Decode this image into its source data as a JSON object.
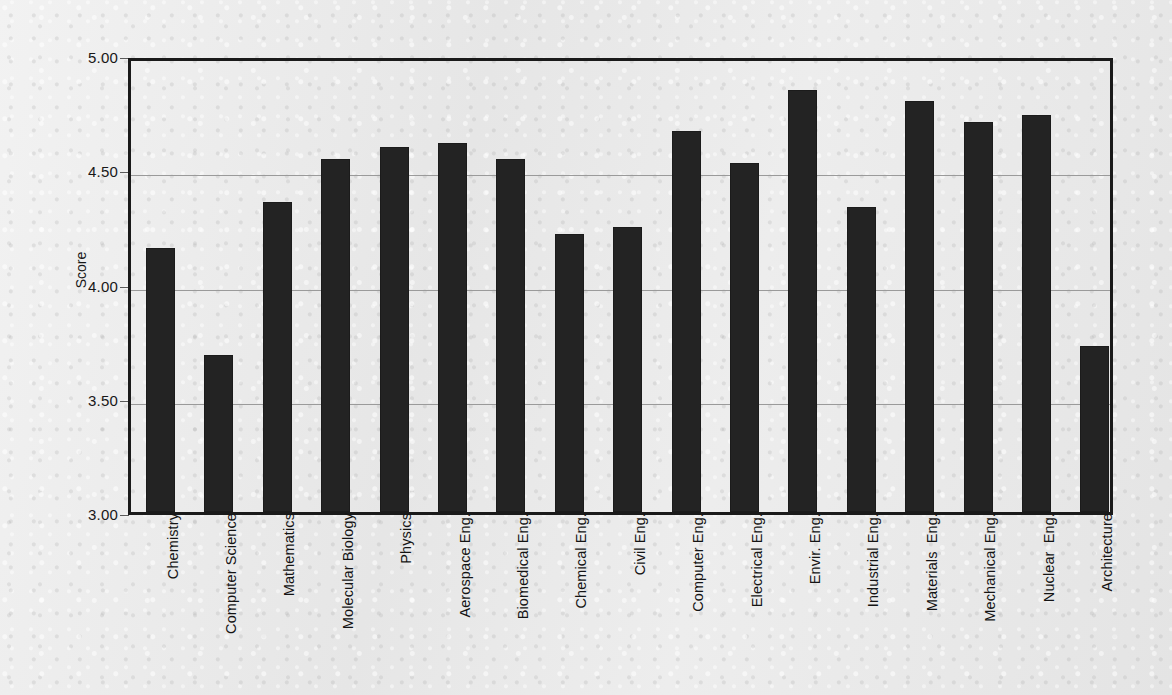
{
  "chart_data": {
    "type": "bar",
    "title": "",
    "subtitle": "",
    "xlabel": "",
    "ylabel": "Score",
    "ylim": [
      3.0,
      5.0
    ],
    "ytick_labels": [
      "5.00",
      "4.50",
      "4.00",
      "3.50",
      "3.00"
    ],
    "ytick_values": [
      5.0,
      4.5,
      4.0,
      3.5,
      3.0
    ],
    "grid": "horizontal",
    "legend": "none",
    "bar_color": "#232323",
    "categories": [
      "Chemistry",
      "Computer Science",
      "Mathematics",
      "Molecular Biology",
      "Physics",
      "Aerospace Eng.",
      "Biomedical Eng.",
      "Chemical Eng.",
      "Civil Eng.",
      "Computer Eng.",
      "Electrical Eng.",
      "Envir. Eng.",
      "Industrial Eng.",
      "Materials  Eng.",
      "Mechanical Eng.",
      "Nuclear  Eng.",
      "Architecture"
    ],
    "values": [
      4.17,
      3.7,
      4.37,
      4.56,
      4.61,
      4.63,
      4.56,
      4.23,
      4.26,
      4.68,
      4.54,
      4.86,
      4.35,
      4.81,
      4.72,
      4.75,
      3.74
    ]
  },
  "figure": {
    "background_color": "#eaeaea",
    "axis_color": "#1a1a1a",
    "gridline_color": "#9a9a9a"
  }
}
